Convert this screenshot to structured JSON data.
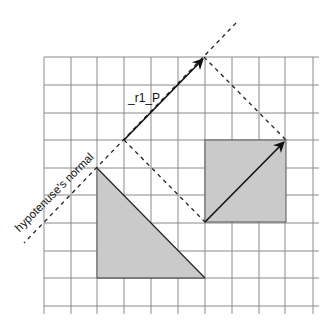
{
  "diagram": {
    "labels": {
      "vector": "_r1_P",
      "normal": "hypotenuse's normal"
    },
    "grid": {
      "x_lines": [
        44,
        71,
        97,
        124,
        151,
        178,
        205,
        232,
        259,
        285,
        313
      ],
      "y_lines": [
        57,
        85,
        113,
        140,
        168,
        195,
        223,
        251,
        278,
        306
      ],
      "x_extent": [
        44,
        319
      ],
      "y_extent": [
        57,
        314
      ],
      "color": "#8a8a8a"
    },
    "shapes": {
      "triangle": {
        "points": [
          [
            97,
            168
          ],
          [
            97,
            278
          ],
          [
            205,
            278
          ]
        ],
        "fill": "#cacaca"
      },
      "square": {
        "x": 205,
        "y": 140,
        "w": 81,
        "h": 82,
        "fill": "#cacaca"
      }
    },
    "vectors": [
      {
        "name": "r1_P",
        "from": [
          124,
          140
        ],
        "to": [
          204,
          58
        ]
      },
      {
        "name": "square-diagonal",
        "from": [
          205,
          222
        ],
        "to": [
          285,
          141
        ]
      }
    ],
    "dashed_lines": [
      {
        "name": "hypotenuse-normal-line",
        "from": [
          236,
          23
        ],
        "to": [
          24,
          243
        ]
      },
      {
        "name": "projection-top",
        "from": [
          204,
          57
        ],
        "to": [
          286,
          140
        ]
      },
      {
        "name": "projection-bottom",
        "from": [
          124,
          140
        ],
        "to": [
          205,
          222
        ]
      }
    ]
  }
}
